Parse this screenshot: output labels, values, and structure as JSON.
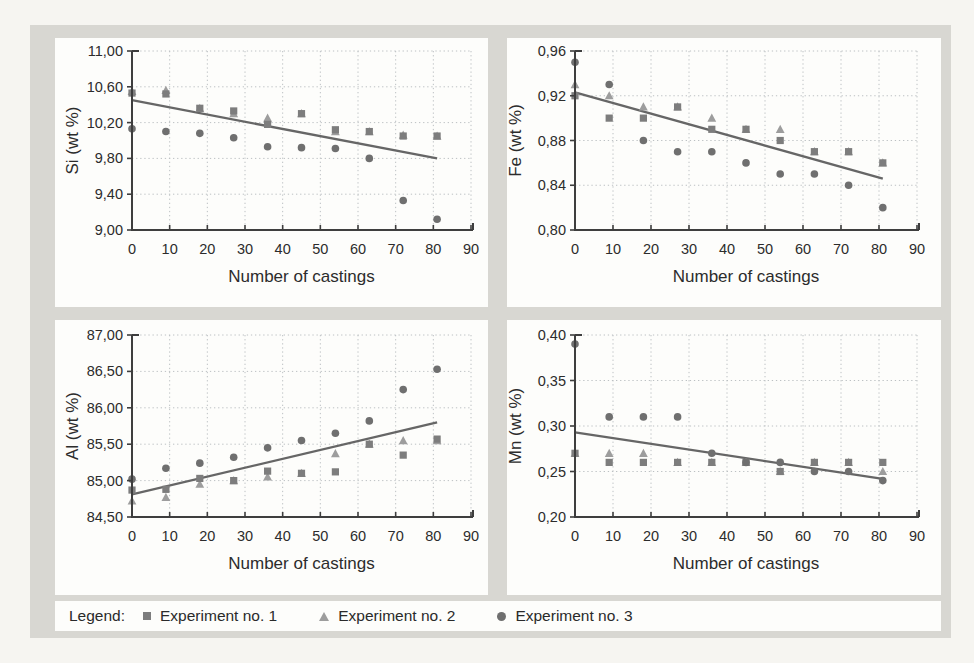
{
  "legend": {
    "title": "Legend:",
    "items": [
      {
        "label": "Experiment no. 1",
        "marker": "square",
        "color": "#7d7d7d"
      },
      {
        "label": "Experiment no. 2",
        "marker": "triangle",
        "color": "#9d9d9d"
      },
      {
        "label": "Experiment no. 3",
        "marker": "circle",
        "color": "#6f6f6f"
      }
    ]
  },
  "colors": {
    "page_bg": "#f6f5f1",
    "container_bg": "#d8d7d2",
    "panel_bg": "#fdfdfb",
    "grid": "#bcc0c3",
    "axis": "#3e3e3e",
    "text": "#2c2c2c",
    "trend": "#666666"
  },
  "chart_data": [
    {
      "id": "si",
      "type": "scatter",
      "title": "",
      "xlabel": "Number of castings",
      "ylabel": "Si (wt %)",
      "xlim": [
        0,
        90
      ],
      "ylim": [
        9.0,
        11.0
      ],
      "xticks": [
        0,
        10,
        20,
        30,
        40,
        50,
        60,
        70,
        80,
        90
      ],
      "yticks": [
        9.0,
        9.4,
        9.8,
        10.2,
        10.6,
        11.0
      ],
      "ytick_labels": [
        "9,00",
        "9,40",
        "9,80",
        "10,20",
        "10,60",
        "11,00"
      ],
      "grid": true,
      "x": [
        0,
        9,
        18,
        27,
        36,
        45,
        54,
        63,
        72,
        81
      ],
      "series": [
        {
          "name": "Experiment no. 1",
          "marker": "square",
          "values": [
            10.53,
            10.52,
            10.36,
            10.33,
            10.18,
            10.3,
            10.12,
            10.1,
            10.05,
            10.05
          ]
        },
        {
          "name": "Experiment no. 2",
          "marker": "triangle",
          "values": [
            10.55,
            10.56,
            10.36,
            10.3,
            10.25,
            10.3,
            10.1,
            10.1,
            10.06,
            10.05
          ]
        },
        {
          "name": "Experiment no. 3",
          "marker": "circle",
          "values": [
            10.13,
            10.1,
            10.08,
            10.03,
            9.93,
            9.92,
            9.91,
            9.8,
            9.33,
            9.12
          ]
        }
      ],
      "trend_line": {
        "x": [
          0,
          81
        ],
        "y": [
          10.45,
          9.8
        ]
      }
    },
    {
      "id": "fe",
      "type": "scatter",
      "title": "",
      "xlabel": "Number of castings",
      "ylabel": "Fe (wt %)",
      "xlim": [
        0,
        90
      ],
      "ylim": [
        0.8,
        0.96
      ],
      "xticks": [
        0,
        10,
        20,
        30,
        40,
        50,
        60,
        70,
        80,
        90
      ],
      "yticks": [
        0.8,
        0.84,
        0.88,
        0.92,
        0.96
      ],
      "ytick_labels": [
        "0,80",
        "0,84",
        "0,88",
        "0,92",
        "0,96"
      ],
      "grid": true,
      "x": [
        0,
        9,
        18,
        27,
        36,
        45,
        54,
        63,
        72,
        81
      ],
      "series": [
        {
          "name": "Experiment no. 1",
          "marker": "square",
          "values": [
            0.92,
            0.9,
            0.9,
            0.91,
            0.89,
            0.89,
            0.88,
            0.87,
            0.87,
            0.86
          ]
        },
        {
          "name": "Experiment no. 2",
          "marker": "triangle",
          "values": [
            0.93,
            0.92,
            0.91,
            0.91,
            0.9,
            0.89,
            0.89,
            0.87,
            0.87,
            0.86
          ]
        },
        {
          "name": "Experiment no. 3",
          "marker": "circle",
          "values": [
            0.95,
            0.93,
            0.88,
            0.87,
            0.87,
            0.86,
            0.85,
            0.85,
            0.84,
            0.82
          ]
        }
      ],
      "trend_line": {
        "x": [
          0,
          81
        ],
        "y": [
          0.923,
          0.846
        ]
      }
    },
    {
      "id": "al",
      "type": "scatter",
      "title": "",
      "xlabel": "Number of castings",
      "ylabel": "Al (wt %)",
      "xlim": [
        0,
        90
      ],
      "ylim": [
        84.5,
        87.0
      ],
      "xticks": [
        0,
        10,
        20,
        30,
        40,
        50,
        60,
        70,
        80,
        90
      ],
      "yticks": [
        84.5,
        85.0,
        85.5,
        86.0,
        86.5,
        87.0
      ],
      "ytick_labels": [
        "84,50",
        "85,00",
        "85,50",
        "86,00",
        "86,50",
        "87,00"
      ],
      "grid": true,
      "x": [
        0,
        9,
        18,
        27,
        36,
        45,
        54,
        63,
        72,
        81
      ],
      "series": [
        {
          "name": "Experiment no. 1",
          "marker": "square",
          "values": [
            84.87,
            84.88,
            85.03,
            85.0,
            85.13,
            85.1,
            85.12,
            85.5,
            85.35,
            85.57
          ]
        },
        {
          "name": "Experiment no. 2",
          "marker": "triangle",
          "values": [
            84.72,
            84.77,
            84.95,
            85.0,
            85.05,
            85.1,
            85.37,
            85.5,
            85.55,
            85.55
          ]
        },
        {
          "name": "Experiment no. 3",
          "marker": "circle",
          "values": [
            85.02,
            85.17,
            85.24,
            85.32,
            85.45,
            85.55,
            85.65,
            85.82,
            86.25,
            86.53
          ]
        }
      ],
      "trend_line": {
        "x": [
          0,
          81
        ],
        "y": [
          84.81,
          85.8
        ]
      }
    },
    {
      "id": "mn",
      "type": "scatter",
      "title": "",
      "xlabel": "Number of castings",
      "ylabel": "Mn (wt %)",
      "xlim": [
        0,
        90
      ],
      "ylim": [
        0.2,
        0.4
      ],
      "xticks": [
        0,
        10,
        20,
        30,
        40,
        50,
        60,
        70,
        80,
        90
      ],
      "yticks": [
        0.2,
        0.25,
        0.3,
        0.35,
        0.4
      ],
      "ytick_labels": [
        "0,20",
        "0,25",
        "0,30",
        "0,35",
        "0,40"
      ],
      "grid": true,
      "x": [
        0,
        9,
        18,
        27,
        36,
        45,
        54,
        63,
        72,
        81
      ],
      "series": [
        {
          "name": "Experiment no. 1",
          "marker": "square",
          "values": [
            0.27,
            0.26,
            0.26,
            0.26,
            0.26,
            0.26,
            0.25,
            0.26,
            0.26,
            0.26
          ]
        },
        {
          "name": "Experiment no. 2",
          "marker": "triangle",
          "values": [
            0.27,
            0.27,
            0.27,
            0.26,
            0.26,
            0.26,
            0.25,
            0.26,
            0.26,
            0.25
          ]
        },
        {
          "name": "Experiment no. 3",
          "marker": "circle",
          "values": [
            0.39,
            0.31,
            0.31,
            0.31,
            0.27,
            0.26,
            0.26,
            0.25,
            0.25,
            0.24
          ]
        }
      ],
      "trend_line": {
        "x": [
          0,
          81
        ],
        "y": [
          0.293,
          0.242
        ]
      }
    }
  ]
}
